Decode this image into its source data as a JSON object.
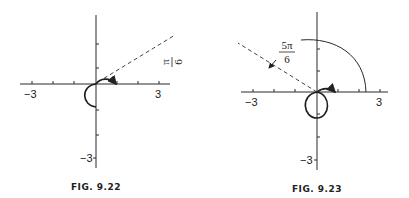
{
  "figures": [
    {
      "caption": "FIG. 9.22",
      "x_neg_label": "−3",
      "x_pos_label": "3",
      "y_neg_label": "−3",
      "angle_num": "π",
      "angle_den": "6",
      "angle_label": "π/6"
    },
    {
      "caption": "FIG. 9.23",
      "x_neg_label": "−3",
      "x_pos_label": "3",
      "y_neg_label": "−3",
      "angle_num": "5π",
      "angle_den": "6",
      "angle_label": "5π/6"
    }
  ]
}
